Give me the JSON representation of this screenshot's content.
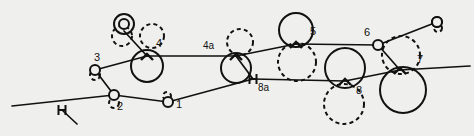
{
  "figure": {
    "background_color": "#efefed",
    "ink_color": "#111111",
    "width": 474,
    "height": 136
  },
  "labels": [
    {
      "id": "label-1",
      "text": "1",
      "x": 176,
      "y": 108
    },
    {
      "id": "label-2",
      "text": "2",
      "x": 117,
      "y": 110
    },
    {
      "id": "label-3",
      "text": "3",
      "x": 94,
      "y": 61
    },
    {
      "id": "label-4",
      "text": "4",
      "x": 156,
      "y": 47
    },
    {
      "id": "label-4a",
      "text": "4a",
      "x": 203,
      "y": 49
    },
    {
      "id": "label-5",
      "text": "5",
      "x": 310,
      "y": 35
    },
    {
      "id": "label-6",
      "text": "6",
      "x": 364,
      "y": 36
    },
    {
      "id": "label-7",
      "text": "7",
      "x": 417,
      "y": 63
    },
    {
      "id": "label-8",
      "text": "8",
      "x": 356,
      "y": 94
    },
    {
      "id": "label-8a",
      "text": "8a",
      "x": 258,
      "y": 91
    }
  ],
  "nodes": [
    {
      "id": "node-left-tick",
      "name": "tick-marker-left",
      "x": 62,
      "y": 110,
      "marker": "tick"
    },
    {
      "id": "node-2",
      "name": "node-2",
      "x": 114,
      "y": 95,
      "marker": "small-circle"
    },
    {
      "id": "node-3",
      "name": "node-3",
      "x": 95,
      "y": 70,
      "marker": "small-circle"
    },
    {
      "id": "node-4",
      "name": "node-4",
      "x": 147,
      "y": 56,
      "marker": "junction"
    },
    {
      "id": "node-1",
      "name": "node-1",
      "x": 168,
      "y": 102,
      "marker": "small-circle"
    },
    {
      "id": "node-4a",
      "name": "node-4a",
      "x": 236,
      "y": 56,
      "marker": "junction"
    },
    {
      "id": "node-8a",
      "name": "node-8a",
      "x": 253,
      "y": 79,
      "marker": "tick"
    },
    {
      "id": "node-5",
      "name": "node-5",
      "x": 296,
      "y": 44,
      "marker": "junction"
    },
    {
      "id": "node-6",
      "name": "node-6",
      "x": 378,
      "y": 45,
      "marker": "small-circle"
    },
    {
      "id": "node-8",
      "name": "node-8",
      "x": 345,
      "y": 81,
      "marker": "junction"
    },
    {
      "id": "node-7",
      "name": "node-7",
      "x": 400,
      "y": 70,
      "marker": "junction"
    },
    {
      "id": "node-top-right",
      "name": "node-top-right",
      "x": 437,
      "y": 22,
      "marker": "small-circle"
    },
    {
      "id": "node-top-left",
      "name": "node-top-left",
      "x": 124,
      "y": 24,
      "marker": "small-circle"
    }
  ],
  "solid_circles": [
    {
      "id": "sc-top-left",
      "cx": 124,
      "cy": 24,
      "r": 10
    },
    {
      "id": "sc-4",
      "cx": 147,
      "cy": 66,
      "r": 16
    },
    {
      "id": "sc-4a",
      "cx": 236,
      "cy": 68,
      "r": 15
    },
    {
      "id": "sc-5",
      "cx": 296,
      "cy": 30,
      "r": 17
    },
    {
      "id": "sc-8",
      "cx": 345,
      "cy": 68,
      "r": 20
    },
    {
      "id": "sc-7",
      "cx": 403,
      "cy": 90,
      "r": 23
    },
    {
      "id": "sc-6",
      "cx": 378,
      "cy": 45,
      "r": 4
    },
    {
      "id": "sc-right-end",
      "cx": 437,
      "cy": 22,
      "r": 5
    }
  ],
  "dashed_circles": [
    {
      "id": "dc-top-left",
      "cx": 122,
      "cy": 36,
      "r": 10
    },
    {
      "id": "dc-4",
      "cx": 152,
      "cy": 36,
      "r": 12
    },
    {
      "id": "dc-3",
      "cx": 95,
      "cy": 75,
      "r": 5
    },
    {
      "id": "dc-2",
      "cx": 114,
      "cy": 103,
      "r": 5
    },
    {
      "id": "dc-1",
      "cx": 167,
      "cy": 96,
      "r": 4
    },
    {
      "id": "dc-4a",
      "cx": 240,
      "cy": 42,
      "r": 13
    },
    {
      "id": "dc-5",
      "cx": 297,
      "cy": 62,
      "r": 19
    },
    {
      "id": "dc-7",
      "cx": 401,
      "cy": 55,
      "r": 19
    },
    {
      "id": "dc-8",
      "cx": 344,
      "cy": 104,
      "r": 20
    },
    {
      "id": "dc-right-end",
      "cx": 438,
      "cy": 28,
      "r": 4
    }
  ],
  "edges": [
    {
      "id": "edge-far-left",
      "x1": 12,
      "y1": 106,
      "x2": 114,
      "y2": 95
    },
    {
      "id": "edge-left-branch",
      "x1": 62,
      "y1": 110,
      "x2": 77,
      "y2": 124
    },
    {
      "id": "edge-2-3",
      "x1": 114,
      "y1": 95,
      "x2": 95,
      "y2": 70
    },
    {
      "id": "edge-3-4",
      "x1": 95,
      "y1": 70,
      "x2": 147,
      "y2": 56
    },
    {
      "id": "edge-4-topleft",
      "x1": 147,
      "y1": 56,
      "x2": 124,
      "y2": 31
    },
    {
      "id": "edge-4-4a",
      "x1": 147,
      "y1": 56,
      "x2": 236,
      "y2": 56
    },
    {
      "id": "edge-2-1",
      "x1": 114,
      "y1": 95,
      "x2": 168,
      "y2": 102
    },
    {
      "id": "edge-1-8a",
      "x1": 168,
      "y1": 102,
      "x2": 253,
      "y2": 79
    },
    {
      "id": "edge-4a-8a",
      "x1": 236,
      "y1": 56,
      "x2": 253,
      "y2": 79
    },
    {
      "id": "edge-4a-5",
      "x1": 236,
      "y1": 56,
      "x2": 296,
      "y2": 44
    },
    {
      "id": "edge-5-6",
      "x1": 296,
      "y1": 44,
      "x2": 378,
      "y2": 45
    },
    {
      "id": "edge-8a-8",
      "x1": 253,
      "y1": 79,
      "x2": 345,
      "y2": 81
    },
    {
      "id": "edge-8-7",
      "x1": 345,
      "y1": 81,
      "x2": 400,
      "y2": 70
    },
    {
      "id": "edge-6-7",
      "x1": 378,
      "y1": 45,
      "x2": 400,
      "y2": 70
    },
    {
      "id": "edge-6-topright",
      "x1": 378,
      "y1": 45,
      "x2": 437,
      "y2": 22
    },
    {
      "id": "edge-7-right",
      "x1": 400,
      "y1": 70,
      "x2": 470,
      "y2": 66
    }
  ]
}
